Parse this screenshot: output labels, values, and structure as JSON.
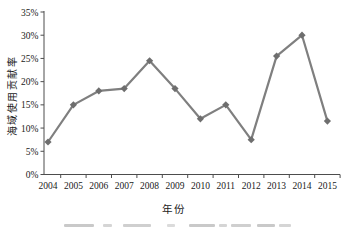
{
  "chart_data": {
    "type": "line",
    "title": "",
    "categories": [
      "2004",
      "2005",
      "2006",
      "2007",
      "2008",
      "2009",
      "2010",
      "2011",
      "2012",
      "2013",
      "2014",
      "2015"
    ],
    "values": [
      7,
      15,
      18,
      18.5,
      24.5,
      18.5,
      12,
      15,
      7.5,
      25.5,
      30,
      11.5
    ],
    "xlabel": "年份",
    "ylabel": "海域使用贡献率",
    "ylim": [
      0,
      35
    ],
    "ytick_step": 5,
    "ytick_labels": [
      "0%",
      "5%",
      "10%",
      "15%",
      "20%",
      "25%",
      "30%",
      "35%"
    ],
    "grid": false,
    "legend_position": "none",
    "marker": "diamond",
    "line_color": "#7f7f7f",
    "marker_color": "#6e6e6e",
    "axis_color": "#4d4d4d",
    "text_color": "#1a1a1a"
  }
}
